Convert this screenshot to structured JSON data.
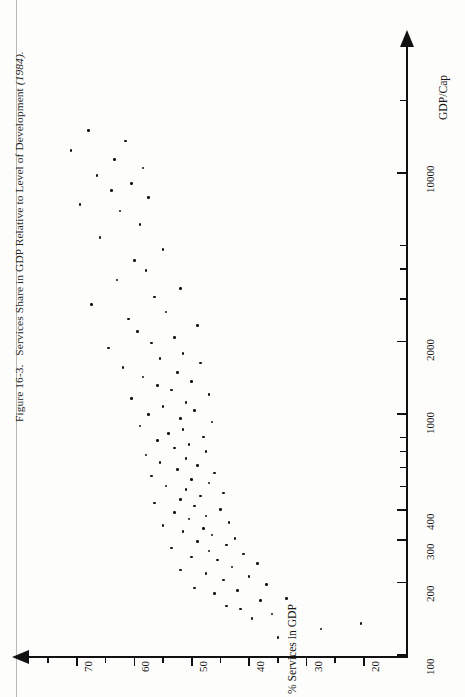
{
  "figure": {
    "caption_number": "Figure 16-3.",
    "caption_text": "Services Share in GDP Relative to Level of Development",
    "caption_year": "(1984).",
    "caption_full": "Figure 16-3.  Services Share in GDP Relative to Level of Development (1984)."
  },
  "chart_data": {
    "type": "scatter",
    "title": "Services Share in GDP Relative to Level of Development (1984)",
    "xlabel": "GDP/Cap",
    "ylabel": "% Services in GDP",
    "xscale": "log",
    "yscale": "linear",
    "xlim": [
      100,
      30000
    ],
    "ylim": [
      15,
      78
    ],
    "grid": false,
    "legend": "none",
    "xticks_major": [
      100,
      200,
      300,
      400,
      1000,
      2000,
      10000
    ],
    "xtick_labels": [
      "100",
      "200",
      "300",
      "400",
      "1000",
      "2000",
      "10000"
    ],
    "xticks_minor": [
      500,
      600,
      700,
      800,
      3000,
      4000,
      5000,
      20000
    ],
    "yticks_major": [
      70,
      60,
      50,
      40,
      30,
      20
    ],
    "ytick_labels": [
      "70",
      "60",
      "50",
      "40",
      "30",
      "20"
    ],
    "yticks_minor": [
      75,
      65,
      55,
      45,
      35,
      25
    ],
    "marker": "dot",
    "marker_color": "#121212",
    "axis_color": "#111111",
    "background": "#fdfdfb",
    "n_points": 104,
    "points": [
      [
        118,
        35.0
      ],
      [
        128,
        27.5
      ],
      [
        135,
        20.5
      ],
      [
        142,
        39.5
      ],
      [
        148,
        36.0
      ],
      [
        155,
        41.5
      ],
      [
        160,
        44.0
      ],
      [
        168,
        38.0
      ],
      [
        172,
        33.5
      ],
      [
        180,
        46.0
      ],
      [
        185,
        42.0
      ],
      [
        190,
        49.5
      ],
      [
        196,
        37.0
      ],
      [
        205,
        44.5
      ],
      [
        212,
        40.0
      ],
      [
        218,
        47.5
      ],
      [
        225,
        52.0
      ],
      [
        232,
        43.0
      ],
      [
        240,
        38.5
      ],
      [
        248,
        45.5
      ],
      [
        255,
        50.0
      ],
      [
        262,
        41.0
      ],
      [
        270,
        47.0
      ],
      [
        278,
        53.5
      ],
      [
        286,
        44.0
      ],
      [
        295,
        49.0
      ],
      [
        305,
        42.5
      ],
      [
        315,
        46.5
      ],
      [
        325,
        51.5
      ],
      [
        335,
        48.0
      ],
      [
        345,
        55.0
      ],
      [
        355,
        43.5
      ],
      [
        366,
        50.5
      ],
      [
        378,
        47.5
      ],
      [
        390,
        53.0
      ],
      [
        402,
        45.0
      ],
      [
        415,
        49.5
      ],
      [
        428,
        56.5
      ],
      [
        442,
        52.0
      ],
      [
        456,
        48.5
      ],
      [
        470,
        44.5
      ],
      [
        486,
        51.0
      ],
      [
        502,
        54.5
      ],
      [
        518,
        47.0
      ],
      [
        535,
        50.0
      ],
      [
        552,
        57.0
      ],
      [
        570,
        46.0
      ],
      [
        590,
        52.5
      ],
      [
        610,
        49.0
      ],
      [
        630,
        55.5
      ],
      [
        652,
        51.0
      ],
      [
        675,
        58.0
      ],
      [
        698,
        47.5
      ],
      [
        722,
        53.0
      ],
      [
        748,
        50.5
      ],
      [
        775,
        56.0
      ],
      [
        802,
        48.0
      ],
      [
        830,
        54.0
      ],
      [
        860,
        51.5
      ],
      [
        892,
        59.0
      ],
      [
        925,
        46.5
      ],
      [
        960,
        52.0
      ],
      [
        996,
        57.5
      ],
      [
        1035,
        49.5
      ],
      [
        1075,
        55.0
      ],
      [
        1118,
        51.0
      ],
      [
        1162,
        60.5
      ],
      [
        1208,
        47.0
      ],
      [
        1258,
        53.5
      ],
      [
        1310,
        56.0
      ],
      [
        1365,
        50.0
      ],
      [
        1425,
        58.5
      ],
      [
        1488,
        52.5
      ],
      [
        1555,
        62.0
      ],
      [
        1626,
        48.5
      ],
      [
        1702,
        55.5
      ],
      [
        1785,
        51.5
      ],
      [
        1875,
        64.5
      ],
      [
        1972,
        57.0
      ],
      [
        2080,
        53.0
      ],
      [
        2200,
        59.5
      ],
      [
        2330,
        49.0
      ],
      [
        2480,
        61.0
      ],
      [
        2650,
        54.5
      ],
      [
        2840,
        67.5
      ],
      [
        3060,
        56.5
      ],
      [
        3310,
        52.0
      ],
      [
        3600,
        63.0
      ],
      [
        3940,
        58.0
      ],
      [
        4340,
        60.0
      ],
      [
        4820,
        55.0
      ],
      [
        5400,
        66.0
      ],
      [
        6100,
        59.0
      ],
      [
        6950,
        62.5
      ],
      [
        7400,
        69.5
      ],
      [
        7900,
        57.5
      ],
      [
        8450,
        64.0
      ],
      [
        9050,
        60.5
      ],
      [
        9750,
        66.5
      ],
      [
        10500,
        58.5
      ],
      [
        11400,
        63.5
      ],
      [
        12400,
        71.0
      ],
      [
        13600,
        61.5
      ],
      [
        15000,
        68.0
      ]
    ]
  }
}
